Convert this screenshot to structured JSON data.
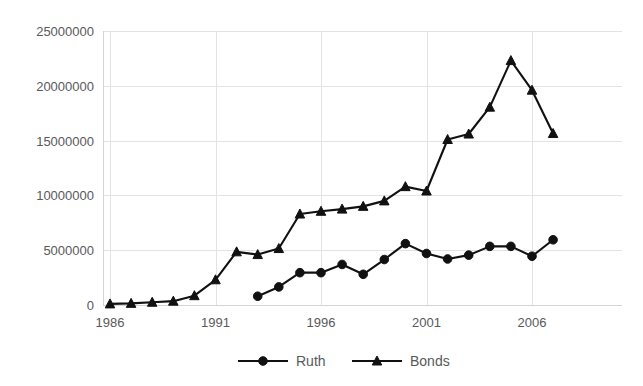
{
  "chart_data": {
    "type": "line",
    "title": "",
    "xlabel": "",
    "ylabel": "",
    "grid": true,
    "legend_position": "bottom",
    "xlim": [
      1986,
      2008
    ],
    "ylim": [
      0,
      25000000
    ],
    "x": [
      1986,
      1987,
      1988,
      1989,
      1990,
      1991,
      1992,
      1993,
      1994,
      1995,
      1996,
      1997,
      1998,
      1999,
      2000,
      2001,
      2002,
      2003,
      2004,
      2005,
      2006,
      2007,
      2008
    ],
    "xticks": [
      1986,
      1991,
      1996,
      2001,
      2006
    ],
    "xtick_labels": [
      "1986",
      "1991",
      "1996",
      "2001",
      "2006"
    ],
    "yticks": [
      0,
      5000000,
      10000000,
      15000000,
      20000000,
      25000000
    ],
    "ytick_labels": [
      "0",
      "5000000",
      "10000000",
      "15000000",
      "20000000",
      "25000000"
    ],
    "series": [
      {
        "name": "Ruth",
        "marker": "circle",
        "color": "#111111",
        "x": [
          1993,
          1994,
          1995,
          1996,
          1997,
          1998,
          1999,
          2000,
          2001,
          2002,
          2003,
          2004,
          2005,
          2006,
          2007,
          2008
        ],
        "values": [
          800000,
          1650000,
          2950000,
          2950000,
          3700000,
          2800000,
          4150000,
          5600000,
          4700000,
          4200000,
          4550000,
          5350000,
          5350000,
          4450000,
          5950000,
          null
        ]
      },
      {
        "name": "Bonds",
        "marker": "triangle",
        "color": "#111111",
        "x": [
          1986,
          1987,
          1988,
          1989,
          1990,
          1991,
          1992,
          1993,
          1994,
          1995,
          1996,
          1997,
          1998,
          1999,
          2000,
          2001,
          2002,
          2003,
          2004,
          2005,
          2006,
          2007
        ],
        "values": [
          100000,
          150000,
          250000,
          350000,
          850000,
          2300000,
          4850000,
          4600000,
          5150000,
          8300000,
          8550000,
          8750000,
          9000000,
          9500000,
          10800000,
          10400000,
          15100000,
          15600000,
          18050000,
          22300000,
          19600000,
          15650000
        ]
      }
    ]
  },
  "legend": {
    "entries": [
      {
        "label": "Ruth",
        "marker": "circle"
      },
      {
        "label": "Bonds",
        "marker": "triangle"
      }
    ]
  },
  "colors": {
    "series": "#111111",
    "gridline": "#e3e3e3",
    "axis": "#d4d4d4",
    "text": "#58595b",
    "background": "#ffffff"
  }
}
